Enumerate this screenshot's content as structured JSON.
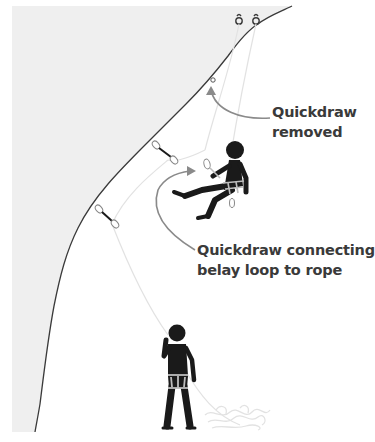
{
  "diagram": {
    "annotations": [
      {
        "id": "quickdraw-removed",
        "lines": [
          "Quickdraw",
          "removed"
        ]
      },
      {
        "id": "quickdraw-connecting",
        "lines": [
          "Quickdraw connecting",
          "belay loop to rope"
        ]
      }
    ],
    "elements": {
      "rock_face": "rock-wall",
      "anchors": [
        "anchor-ring-left",
        "anchor-ring-right"
      ],
      "quickdraws_on_wall": 2,
      "figures": [
        "climber-lowering",
        "belayer-standing"
      ],
      "rope_pile": "coiled-rope"
    },
    "colors": {
      "rock": "#efefef",
      "cliff_edge": "#3a3a3a",
      "figure": "#1a1a1a",
      "harness": "#bdbdbd",
      "rope": "#e2e2e2",
      "arrow": "#8a8a8a",
      "text": "#3a3a3a"
    }
  }
}
